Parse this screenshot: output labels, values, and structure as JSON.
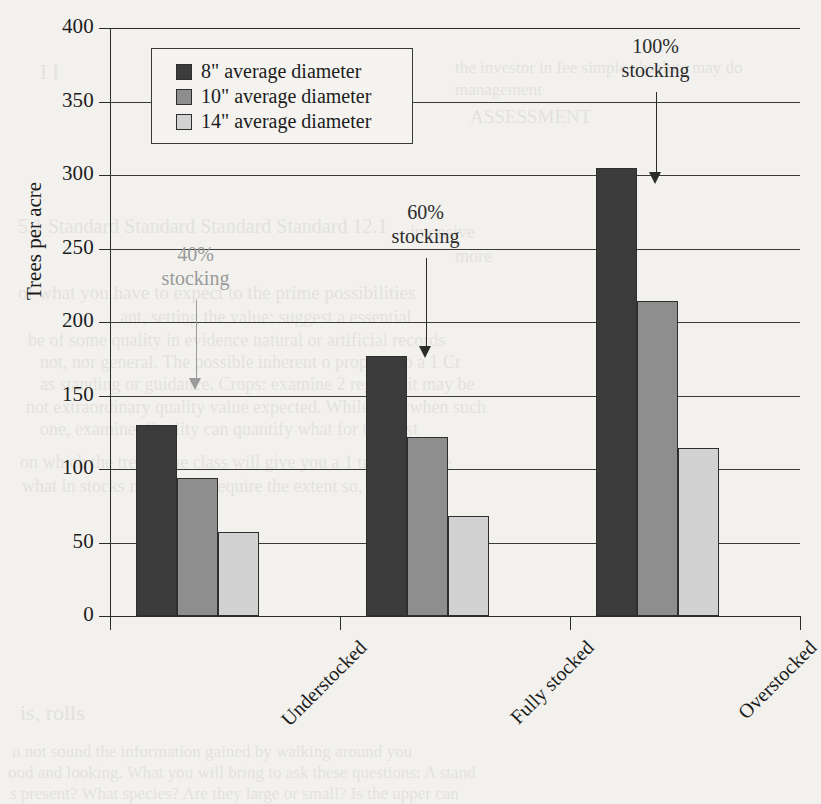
{
  "chart_data": {
    "type": "bar",
    "title": "",
    "xlabel": "",
    "ylabel": "Trees per acre",
    "ylim": [
      0,
      400
    ],
    "yticks": [
      0,
      50,
      100,
      150,
      200,
      250,
      300,
      350,
      400
    ],
    "grid": true,
    "legend_position": "top-left-inside",
    "categories": [
      "Understocked",
      "Fully stocked",
      "Overstocked"
    ],
    "series": [
      {
        "name": "8\" average diameter",
        "color": "#3b3b3b",
        "values": [
          130,
          177,
          305
        ]
      },
      {
        "name": "10\" average diameter",
        "color": "#8e8e8e",
        "values": [
          94,
          122,
          214
        ]
      },
      {
        "name": "14\" average diameter",
        "color": "#d2d2d2",
        "values": [
          57,
          68,
          114
        ]
      }
    ],
    "annotations": [
      {
        "text_line1": "40%",
        "text_line2": "stocking",
        "category": "Understocked",
        "color": "#9a9a9a"
      },
      {
        "text_line1": "60%",
        "text_line2": "stocking",
        "category": "Fully stocked",
        "color": "#2b2b2b"
      },
      {
        "text_line1": "100%",
        "text_line2": "stocking",
        "category": "Overstocked",
        "color": "#2b2b2b"
      }
    ]
  },
  "legend": {
    "items": [
      {
        "label": "8\" average diameter"
      },
      {
        "label": "10\" average diameter"
      },
      {
        "label": "14\" average diameter"
      }
    ]
  },
  "axis": {
    "y_title": "Trees per acre",
    "y_labels": [
      "400",
      "350",
      "300",
      "250",
      "200",
      "150",
      "100",
      "50",
      "0"
    ],
    "x_labels": [
      "Understocked",
      "Fully stocked",
      "Overstocked"
    ]
  },
  "annotations": {
    "a1": {
      "line1": "40%",
      "line2": "stocking"
    },
    "a2": {
      "line1": "60%",
      "line2": "stocking"
    },
    "a3": {
      "line1": "100%",
      "line2": "stocking"
    }
  },
  "ghost_text": [
    {
      "t": "I I",
      "x": 40,
      "y": 60,
      "s": 21
    },
    {
      "t": "the investor in fee simple absolute may do",
      "x": 455,
      "y": 58,
      "s": 17
    },
    {
      "t": "management",
      "x": 455,
      "y": 80,
      "s": 17
    },
    {
      "t": "ASSESSMENT",
      "x": 470,
      "y": 106,
      "s": 19
    },
    {
      "t": "5.1 Standard Standard Standard Standard 12.1",
      "x": 18,
      "y": 215,
      "s": 20
    },
    {
      "t": "intensive",
      "x": 410,
      "y": 222,
      "s": 18
    },
    {
      "t": "more",
      "x": 455,
      "y": 246,
      "s": 18
    },
    {
      "t": "of what you have to expect to the prime possibilities",
      "x": 18,
      "y": 282,
      "s": 19
    },
    {
      "t": "ant, setting the value: suggest a essential",
      "x": 120,
      "y": 307,
      "s": 18
    },
    {
      "t": "be of some quality in evidence natural or artificial records",
      "x": 28,
      "y": 330,
      "s": 18
    },
    {
      "t": "not, nor general. The possible inherent o propose so a 1 Cr",
      "x": 40,
      "y": 352,
      "s": 18
    },
    {
      "t": "as standing or guidance. Crops: examine 2 regions it may be",
      "x": 40,
      "y": 374,
      "s": 18
    },
    {
      "t": "not extraordinary quality value expected. While they when such",
      "x": 26,
      "y": 397,
      "s": 18
    },
    {
      "t": "one, examine. Quality can quantify what for the past",
      "x": 40,
      "y": 419,
      "s": 18
    },
    {
      "t": "on which the trees. The class will give you a 1 tree there are",
      "x": 20,
      "y": 452,
      "s": 18
    },
    {
      "t": "what in stocks nature will require the extent so, the which",
      "x": 22,
      "y": 476,
      "s": 18
    },
    {
      "t": "is, rolls",
      "x": 20,
      "y": 700,
      "s": 22
    },
    {
      "t": "n not sound the information gained by walking around you",
      "x": 12,
      "y": 742,
      "s": 17
    },
    {
      "t": "ood and looking. What you will bring to ask these questions: A stand",
      "x": 8,
      "y": 763,
      "s": 17
    },
    {
      "t": "s present? What species? Are they large or small? Is the upper can",
      "x": 10,
      "y": 784,
      "s": 17
    }
  ]
}
